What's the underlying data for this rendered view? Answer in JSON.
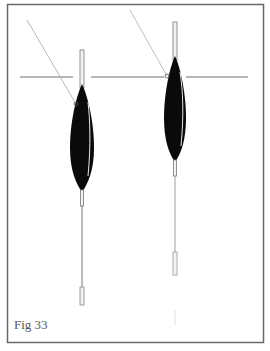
{
  "figure": {
    "caption": "Fig 33",
    "colors": {
      "frame": "#6a6a6a",
      "water_line": "#6e6e6e",
      "float_body": "#0a0a0a",
      "antenna": "#8a8a8a",
      "line": "#b5b5b5",
      "caption": "#555555"
    },
    "water_line": {
      "y": 77,
      "x_start": 20,
      "x_end": 248
    },
    "floats": [
      {
        "name": "float-left",
        "x": 82,
        "antenna_top": 50,
        "body_top": 86,
        "body_bottom": 190,
        "body_width": 22,
        "stem_bottom": 206,
        "wire_bottom": 287,
        "tube_bottom": 305,
        "line_from": [
          27,
          20
        ],
        "line_to": [
          76,
          104
        ]
      },
      {
        "name": "float-right",
        "x": 175,
        "antenna_top": 22,
        "body_top": 58,
        "body_bottom": 160,
        "body_width": 22,
        "stem_bottom": 176,
        "wire_bottom": 252,
        "tube_bottom": 275,
        "line_from": [
          130,
          10
        ],
        "line_to": [
          167,
          76
        ]
      }
    ]
  }
}
